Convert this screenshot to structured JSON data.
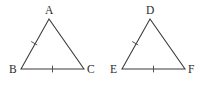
{
  "figure": {
    "type": "geometry-diagram",
    "background_color": "#ffffff",
    "line_color": "#3a3a3a",
    "label_color": "#2b2b2b",
    "tick_color": "#4a4a4a",
    "shapes": [
      {
        "name": "triangle-abc",
        "labels": {
          "apex": "A",
          "bottom_left": "B",
          "bottom_right": "C"
        },
        "vertices": {
          "apex": {
            "x": 49,
            "y": 19
          },
          "bottom_left": {
            "x": 21,
            "y": 69
          },
          "bottom_right": {
            "x": 84,
            "y": 69
          }
        },
        "label_positions": {
          "apex": {
            "x": 45,
            "y": 14
          },
          "bottom_left": {
            "x": 9,
            "y": 73
          },
          "bottom_right": {
            "x": 87,
            "y": 73
          }
        },
        "ticks": [
          {
            "name": "tick-side-ab",
            "count": 1
          },
          {
            "name": "tick-side-bc",
            "count": 1
          }
        ]
      },
      {
        "name": "triangle-def",
        "labels": {
          "apex": "D",
          "bottom_left": "E",
          "bottom_right": "F"
        },
        "vertices": {
          "apex": {
            "x": 150,
            "y": 19
          },
          "bottom_left": {
            "x": 122,
            "y": 69
          },
          "bottom_right": {
            "x": 185,
            "y": 69
          }
        },
        "label_positions": {
          "apex": {
            "x": 146,
            "y": 14
          },
          "bottom_left": {
            "x": 110,
            "y": 73
          },
          "bottom_right": {
            "x": 188,
            "y": 73
          }
        },
        "ticks": [
          {
            "name": "tick-side-de",
            "count": 1
          },
          {
            "name": "tick-side-ef",
            "count": 1
          }
        ]
      }
    ]
  }
}
